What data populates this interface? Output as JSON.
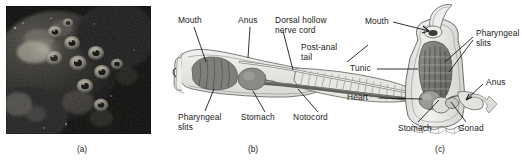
{
  "figure": {
    "panels": [
      {
        "id": "a",
        "caption": "(a)",
        "kind": "photograph",
        "description": "dark underwater photograph of tunicates (sea squirts) on a reef",
        "labels": []
      },
      {
        "id": "b",
        "caption": "(b)",
        "kind": "diagram",
        "description": "lateral view of a chordate larva / lancelet showing chordate characteristics",
        "labels": [
          {
            "name": "mouth",
            "text": "Mouth"
          },
          {
            "name": "anus",
            "text": "Anus"
          },
          {
            "name": "dorsal-hollow-nerve-cord",
            "text": "Dorsal hollow\nnerve cord"
          },
          {
            "name": "post-anal-tail",
            "text": "Post-anal\ntail"
          },
          {
            "name": "pharyngeal-slits",
            "text": "Pharyngeal\nslits"
          },
          {
            "name": "stomach",
            "text": "Stomach"
          },
          {
            "name": "notochord",
            "text": "Notocord"
          }
        ]
      },
      {
        "id": "c",
        "caption": "(c)",
        "kind": "diagram",
        "description": "cutaway view of an adult tunicate showing internal anatomy",
        "labels": [
          {
            "name": "mouth",
            "text": "Mouth"
          },
          {
            "name": "pharyngeal-slits",
            "text": "Pharyngeal\nslits"
          },
          {
            "name": "tunic",
            "text": "Tunic"
          },
          {
            "name": "anus",
            "text": "Anus"
          },
          {
            "name": "heart",
            "text": "Heart"
          },
          {
            "name": "stomach",
            "text": "Stomach"
          },
          {
            "name": "gonad",
            "text": "Gonad"
          }
        ]
      }
    ],
    "colors": {
      "ink": "#1a1a1a",
      "body_outline": "#5a5a5a",
      "body_fill_light": "#e8e8e6",
      "body_fill_mid": "#c8c8c6",
      "organ_dark": "#7d7d7d",
      "organ_darker": "#636363",
      "photo_background": "#0d0d0d"
    }
  }
}
